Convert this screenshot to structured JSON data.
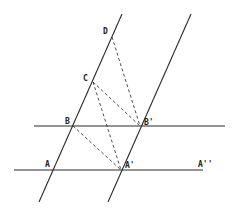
{
  "diagram": {
    "type": "geometric-construction",
    "points": {
      "A": {
        "label": "A",
        "x": 54,
        "y": 170
      },
      "B": {
        "label": "B",
        "x": 73,
        "y": 126
      },
      "C": {
        "label": "C",
        "x": 93,
        "y": 82
      },
      "D": {
        "label": "D",
        "x": 112,
        "y": 37
      },
      "A1": {
        "label": "A'",
        "x": 121,
        "y": 170
      },
      "B1": {
        "label": "B'",
        "x": 140,
        "y": 126
      },
      "A2": {
        "label": "A''",
        "x": 200,
        "y": 170
      }
    },
    "solid_lines": [
      {
        "name": "line-abcd",
        "x1": 122,
        "y1": 14,
        "x2": 39,
        "y2": 202
      },
      {
        "name": "line-a1b1",
        "x1": 191,
        "y1": 14,
        "x2": 108,
        "y2": 202
      },
      {
        "name": "line-bb1",
        "x1": 34,
        "y1": 126,
        "x2": 225,
        "y2": 126
      },
      {
        "name": "line-aa1a2",
        "x1": 14,
        "y1": 170,
        "x2": 203,
        "y2": 170
      }
    ],
    "dashed_lines": [
      {
        "name": "segment-d-b1",
        "from": "D",
        "to": "B1"
      },
      {
        "name": "segment-c-b1",
        "from": "C",
        "to": "B1"
      },
      {
        "name": "segment-c-a1",
        "from": "C",
        "to": "A1"
      },
      {
        "name": "segment-b-a1",
        "from": "B",
        "to": "A1"
      }
    ],
    "labels": [
      {
        "key": "D",
        "text": "D",
        "x": 103,
        "y": 34
      },
      {
        "key": "C",
        "text": "C",
        "x": 83,
        "y": 81
      },
      {
        "key": "B",
        "text": "B",
        "x": 65,
        "y": 124
      },
      {
        "key": "B1",
        "text": "B'",
        "x": 144,
        "y": 125
      },
      {
        "key": "A",
        "text": "A",
        "x": 45,
        "y": 167
      },
      {
        "key": "A1",
        "text": "A'",
        "x": 125,
        "y": 168
      },
      {
        "key": "A2",
        "text": "A''",
        "x": 198,
        "y": 167
      }
    ]
  }
}
